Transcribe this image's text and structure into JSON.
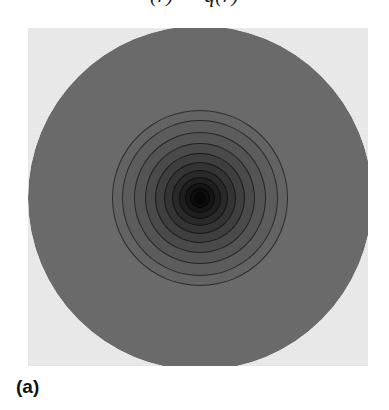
{
  "figure": {
    "caption_fragment": "(r) — q(r)",
    "subfigure_label": "(a)",
    "panel": {
      "background_color": "#ececed",
      "left": 28,
      "top": 28,
      "width": 340,
      "height": 338
    }
  },
  "chart_data": {
    "type": "contour",
    "title": "",
    "subtitle": "",
    "xlabel": "",
    "ylabel": "",
    "annotations": [
      "(a)"
    ],
    "legend": [],
    "grid": false,
    "axes_visible": false,
    "tick_labels": [],
    "geometry": {
      "domain": "disk",
      "center_x": 200,
      "center_y": 198,
      "outer_radius": 172,
      "coordinate": "radius"
    },
    "colormap": {
      "name": "grayscale",
      "low_value_color": "#6a6a6a",
      "high_value_color": "#0a0a0a",
      "panel_color": "#ececed"
    },
    "contour_levels": [
      {
        "level": 1,
        "radius": 172,
        "fill": "#6a6a6a",
        "line": false
      },
      {
        "level": 2,
        "radius": 88,
        "fill": "#636363",
        "line": true
      },
      {
        "level": 3,
        "radius": 78,
        "fill": "#5c5c5c",
        "line": true
      },
      {
        "level": 4,
        "radius": 66,
        "fill": "#545454",
        "line": true
      },
      {
        "level": 5,
        "radius": 55,
        "fill": "#4a4a4a",
        "line": true
      },
      {
        "level": 6,
        "radius": 45,
        "fill": "#3f3f3f",
        "line": true
      },
      {
        "level": 7,
        "radius": 36,
        "fill": "#343434",
        "line": true
      },
      {
        "level": 8,
        "radius": 28,
        "fill": "#292929",
        "line": true
      },
      {
        "level": 9,
        "radius": 21,
        "fill": "#1e1e1e",
        "line": true
      },
      {
        "level": 10,
        "radius": 15,
        "fill": "#151515",
        "line": true
      },
      {
        "level": 11,
        "radius": 10,
        "fill": "#0d0d0d",
        "line": true
      },
      {
        "level": 12,
        "radius": 6,
        "fill": "#070707",
        "line": false
      }
    ],
    "radial_profile": {
      "r": [
        0,
        6,
        10,
        15,
        21,
        28,
        36,
        45,
        55,
        66,
        78,
        88,
        120,
        172
      ],
      "value": [
        1.0,
        0.96,
        0.9,
        0.82,
        0.72,
        0.61,
        0.5,
        0.4,
        0.3,
        0.22,
        0.14,
        0.08,
        0.02,
        0.0
      ]
    }
  }
}
